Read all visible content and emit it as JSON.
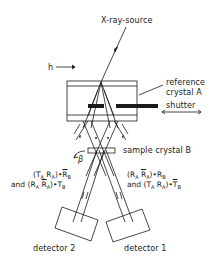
{
  "labels": {
    "source": "X-ray-source",
    "h": "h",
    "reference_line1": "reference",
    "reference_line2": "crystal A",
    "shutter": "shutter",
    "sample": "sample crystal B",
    "beta": "β",
    "detector2": "detector 2",
    "detector1": "detector 1"
  },
  "formulas": {
    "left": {
      "line1": [
        "(T",
        "A",
        " R",
        "A",
        ")•",
        "R",
        "B"
      ],
      "line1_overbar": [
        false,
        false,
        false,
        false,
        false,
        true,
        false
      ],
      "line2_prefix": "and ",
      "line2": [
        "(R",
        "A",
        " ",
        "R",
        "A",
        ")•T",
        "B"
      ],
      "line2_overbar": [
        false,
        false,
        false,
        true,
        false,
        false,
        false
      ]
    },
    "right": {
      "line1": [
        "(R",
        "A",
        " ",
        "R",
        "A",
        ")•R",
        "B"
      ],
      "line1_overbar": [
        false,
        false,
        false,
        true,
        false,
        false,
        false
      ],
      "line2_prefix": "and ",
      "line2": [
        "(T",
        "A",
        " R",
        "A",
        ")•",
        "T",
        "B"
      ],
      "line2_overbar": [
        false,
        false,
        false,
        false,
        false,
        true,
        false
      ]
    }
  },
  "colors": {
    "ink": "#1a1a1a",
    "background": "#ffffff"
  }
}
